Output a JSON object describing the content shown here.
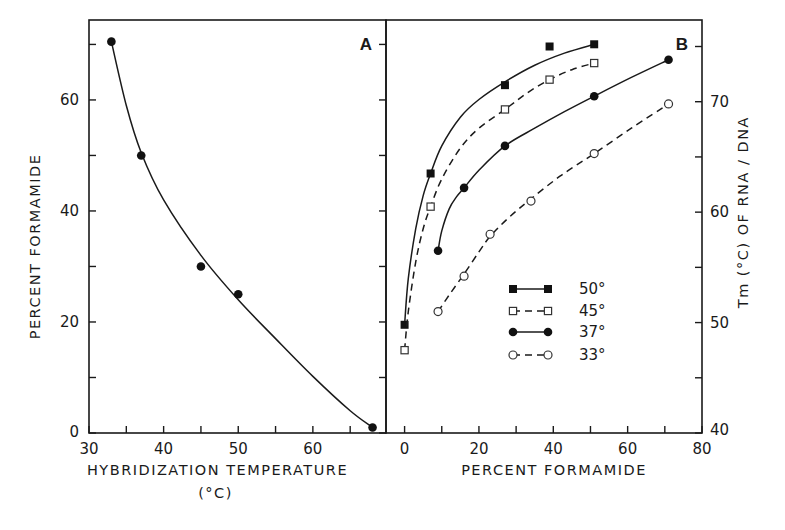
{
  "chart_data": [
    {
      "panel": "A",
      "type": "line",
      "panel_label": "A",
      "xlabel": "HYBRIDIZATION TEMPERATURE",
      "xlabel_unit": "(°C)",
      "ylabel": "PERCENT FORMAMIDE",
      "xlim": [
        30,
        69.8
      ],
      "ylim": [
        0,
        74.4
      ],
      "xticks": [
        30,
        35,
        40,
        45,
        50,
        55,
        60,
        65
      ],
      "xtick_labels": [
        "30",
        "40",
        "50",
        "60"
      ],
      "xtick_label_values": [
        30,
        40,
        50,
        60
      ],
      "yticks": [
        0,
        10,
        20,
        30,
        40,
        50,
        60,
        70
      ],
      "ytick_labels": [
        "0",
        "20",
        "40",
        "60"
      ],
      "ytick_label_values": [
        0,
        20,
        40,
        60
      ],
      "grid": false,
      "series": [
        {
          "name": "hybridization",
          "marker": "filled-circle",
          "line": "solid",
          "points": [
            [
              33,
              70.5
            ],
            [
              37,
              50
            ],
            [
              45,
              30
            ],
            [
              50,
              25
            ],
            [
              68,
              1
            ]
          ],
          "fit": [
            [
              33,
              70.5
            ],
            [
              35,
              59
            ],
            [
              37,
              50.5
            ],
            [
              40,
              42
            ],
            [
              45,
              32
            ],
            [
              50,
              24
            ],
            [
              55,
              17
            ],
            [
              60,
              10.2
            ],
            [
              65,
              4
            ],
            [
              68,
              1
            ]
          ]
        }
      ]
    },
    {
      "panel": "B",
      "type": "line",
      "panel_label": "B",
      "xlabel": "PERCENT FORMAMIDE",
      "ylabel": "Tm (°C) OF RNA / DNA",
      "xlim": [
        -5,
        80
      ],
      "ylim": [
        40,
        77.4
      ],
      "xticks": [
        0,
        10,
        20,
        30,
        40,
        50,
        60,
        70,
        80
      ],
      "xtick_labels": [
        "0",
        "20",
        "40",
        "60",
        "80"
      ],
      "xtick_label_values": [
        0,
        20,
        40,
        60,
        80
      ],
      "yticks": [
        40,
        45,
        50,
        55,
        60,
        65,
        70,
        75
      ],
      "ytick_labels": [
        "40",
        "50",
        "60",
        "70"
      ],
      "ytick_label_values": [
        40,
        50,
        60,
        70
      ],
      "grid": false,
      "legend_position": "center",
      "series": [
        {
          "name": "50°",
          "marker": "filled-square",
          "line": "solid",
          "points": [
            [
              0,
              49.8
            ],
            [
              7,
              63.5
            ],
            [
              27,
              71.5
            ],
            [
              39,
              75
            ],
            [
              51,
              75.2
            ]
          ],
          "fit": [
            [
              0,
              49.8
            ],
            [
              1,
              54
            ],
            [
              3,
              58.5
            ],
            [
              5,
              61.5
            ],
            [
              7,
              63.5
            ],
            [
              10,
              66
            ],
            [
              15,
              68.6
            ],
            [
              20,
              70.2
            ],
            [
              27,
              71.8
            ],
            [
              35,
              73.3
            ],
            [
              43,
              74.4
            ],
            [
              51,
              75.2
            ]
          ]
        },
        {
          "name": "45°",
          "marker": "open-square",
          "line": "dashed",
          "points": [
            [
              0,
              47.5
            ],
            [
              7,
              60.5
            ],
            [
              27,
              69.3
            ],
            [
              39,
              72
            ],
            [
              51,
              73.5
            ]
          ],
          "fit": [
            [
              0,
              47.5
            ],
            [
              1,
              51
            ],
            [
              3,
              55.5
            ],
            [
              5,
              58.5
            ],
            [
              7,
              60.5
            ],
            [
              10,
              63
            ],
            [
              15,
              65.8
            ],
            [
              20,
              67.6
            ],
            [
              27,
              69.3
            ],
            [
              33,
              70.8
            ],
            [
              39,
              72
            ],
            [
              45,
              72.9
            ],
            [
              51,
              73.5
            ]
          ]
        },
        {
          "name": "37°",
          "marker": "filled-circle",
          "line": "solid",
          "points": [
            [
              9,
              56.5
            ],
            [
              16,
              62.2
            ],
            [
              27,
              66
            ],
            [
              51,
              70.5
            ],
            [
              71,
              73.8
            ]
          ],
          "fit": [
            [
              9,
              56.5
            ],
            [
              10,
              58.3
            ],
            [
              12,
              60.3
            ],
            [
              14,
              61.4
            ],
            [
              16,
              62.2
            ],
            [
              20,
              63.8
            ],
            [
              27,
              66
            ],
            [
              35,
              67.6
            ],
            [
              43,
              69.1
            ],
            [
              51,
              70.5
            ],
            [
              61,
              72.2
            ],
            [
              71,
              73.8
            ]
          ]
        },
        {
          "name": "33°",
          "marker": "open-circle",
          "line": "dashed",
          "points": [
            [
              9,
              51
            ],
            [
              16,
              54.2
            ],
            [
              23,
              58
            ],
            [
              34,
              61
            ],
            [
              51,
              65.3
            ],
            [
              71,
              69.8
            ]
          ],
          "fit": [
            [
              9,
              51
            ],
            [
              12,
              52.5
            ],
            [
              16,
              54.4
            ],
            [
              20,
              56.4
            ],
            [
              23,
              57.8
            ],
            [
              28,
              59.5
            ],
            [
              34,
              61.2
            ],
            [
              42,
              63.3
            ],
            [
              51,
              65.3
            ],
            [
              61,
              67.6
            ],
            [
              71,
              69.8
            ]
          ]
        }
      ]
    }
  ]
}
